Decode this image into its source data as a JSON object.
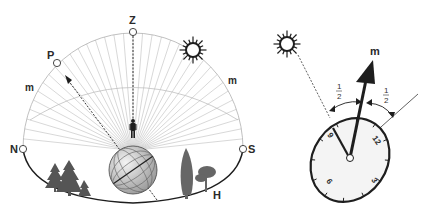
{
  "celestial_sphere": {
    "labels": {
      "zenith": "Z",
      "pole": "P",
      "north": "N",
      "south": "S",
      "horizon": "H",
      "meridian_left": "m",
      "meridian_right": "m"
    },
    "sun_icon": "sun-icon",
    "observer_icon": "person-icon",
    "globe_icon": "globe-icon"
  },
  "watch_method": {
    "labels": {
      "meridian": "m",
      "half_left_num": "1",
      "half_left_den": "2",
      "half_right_num": "1",
      "half_right_den": "2",
      "hour_12": "12",
      "hour_3": "3",
      "hour_6": "6",
      "hour_9": "9"
    },
    "sun_icon": "sun-icon"
  },
  "colors": {
    "ink": "#1e1e1e",
    "grid": "#b5b5b5",
    "tree": "#6a6a6a"
  }
}
